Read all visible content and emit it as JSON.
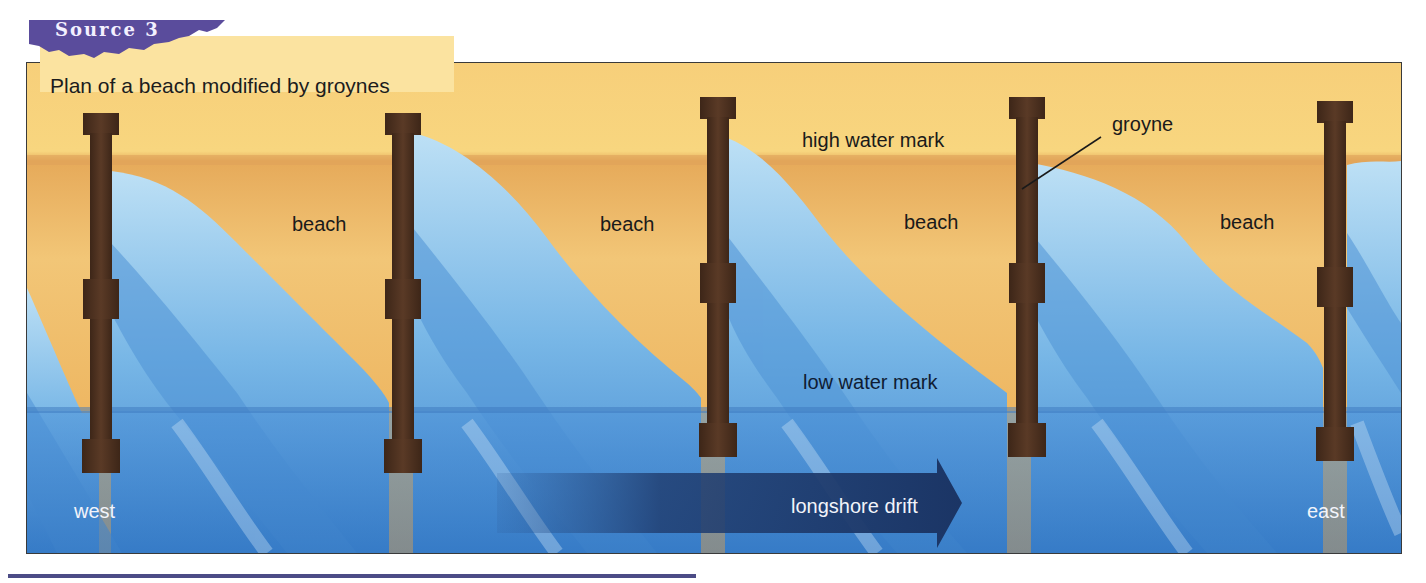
{
  "header": {
    "source_label": "Source 3",
    "caption": "Plan of a beach modified by groynes"
  },
  "labels": {
    "beach": [
      "beach",
      "beach",
      "beach",
      "beach"
    ],
    "high_water_mark": "high water mark",
    "low_water_mark": "low water mark",
    "groyne": "groyne",
    "longshore_drift": "longshore drift",
    "west": "west",
    "east": "east"
  },
  "colors": {
    "sand_light": "#f8d27a",
    "sand_dark": "#e6a653",
    "water_shallow": "#a9d4f0",
    "water_mid": "#5fa1de",
    "water_deep": "#3d82cc",
    "groyne": "#4a2f1f",
    "arrow": "#1f3d6e",
    "source_tab": "#5a4c9c",
    "caption_bg": "#fbe3a0"
  },
  "diagram": {
    "groyne_count": 5,
    "direction": "west to east"
  }
}
